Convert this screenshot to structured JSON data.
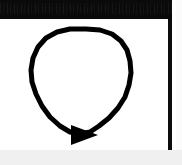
{
  "page": {
    "width": 182,
    "height": 165,
    "background_color": "#f2f2f2",
    "paper_color": "#ffffff"
  },
  "header": {
    "band_color": "#0a0a0a",
    "text": "illegible scanned header text",
    "legible": false
  },
  "figure": {
    "name": "circular-arrow-diagram",
    "stroke_color": "#000000",
    "stroke_width": 5,
    "fill": "none",
    "direction": "clockwise",
    "arrowhead": {
      "shape": "solid-triangle",
      "points_toward": "right",
      "center_x": 85,
      "center_y": 135
    },
    "loop_bounds": {
      "left": 31,
      "top": 29,
      "right": 131,
      "bottom": 140
    }
  },
  "rules": {
    "right_vertical_rule_color": "#0c0c0c"
  }
}
